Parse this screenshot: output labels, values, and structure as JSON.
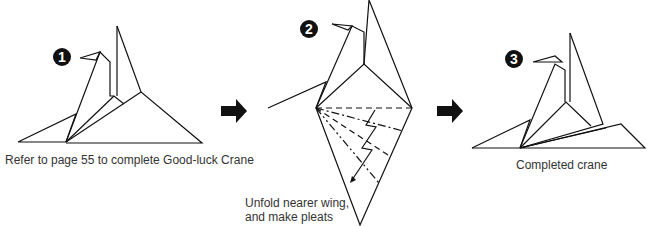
{
  "steps": [
    {
      "number": "1",
      "caption": "Refer to page 55 to complete Good-luck Crane"
    },
    {
      "number": "2",
      "caption_line1": "Unfold nearer wing,",
      "caption_line2": "and make pleats"
    },
    {
      "number": "3",
      "caption": "Completed crane"
    }
  ],
  "icons": {
    "arrow": "right-arrow-icon"
  },
  "colors": {
    "line": "#111111",
    "background": "#ffffff"
  }
}
